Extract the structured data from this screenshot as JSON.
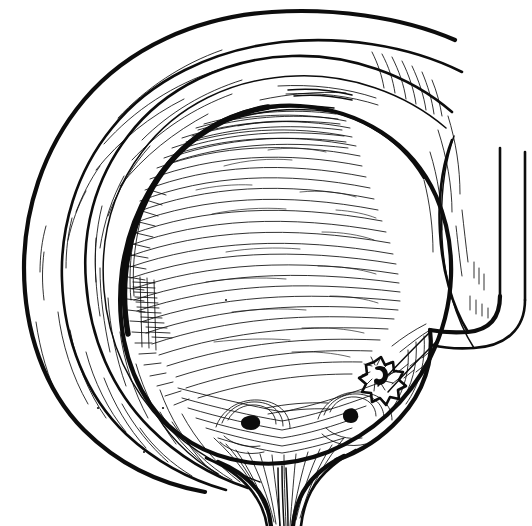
{
  "figure": {
    "kind": "anatomical-line-drawing",
    "technique": "pen-and-ink hatching",
    "background_color": "#ffffff",
    "ink_color": "#0d0d0d",
    "width": 532,
    "height": 526,
    "caption": "",
    "label_text": "",
    "visible_text": []
  },
  "structures": {
    "outer_flap": {
      "name": "outer bladder wall flap",
      "description": "large crescent arc sweeping from upper-right over the top and down the left side"
    },
    "middle_flap": {
      "name": "middle bladder wall layer",
      "description": "second concentric crescent inside the outer flap"
    },
    "bladder_cavity": {
      "name": "bladder interior",
      "description": "ovoid cavity rendered with fine contour hatching, dense at the left and upper rim"
    },
    "ureter_tube": {
      "name": "reimplanted ureter",
      "description": "tube descending from upper right, curving left to enter the bladder wall"
    },
    "neo_orifice": {
      "name": "neo-ureteric stoma",
      "description": "stellate puckered opening on the right inferior wall with comma-shaped lumen"
    },
    "trigone": {
      "name": "trigone",
      "description": "triangular smooth area at the bladder base"
    },
    "left_orifice": {
      "name": "left ureteric orifice",
      "description": "dark slit surrounded by concentric mucosal folds"
    },
    "right_orifice": {
      "name": "right ureteric orifice",
      "description": "dark slit surrounded by concentric mucosal folds"
    },
    "bladder_neck": {
      "name": "bladder neck and proximal urethra",
      "description": "funnel at the base with radiating mucosal folds converging into the urethra"
    }
  }
}
